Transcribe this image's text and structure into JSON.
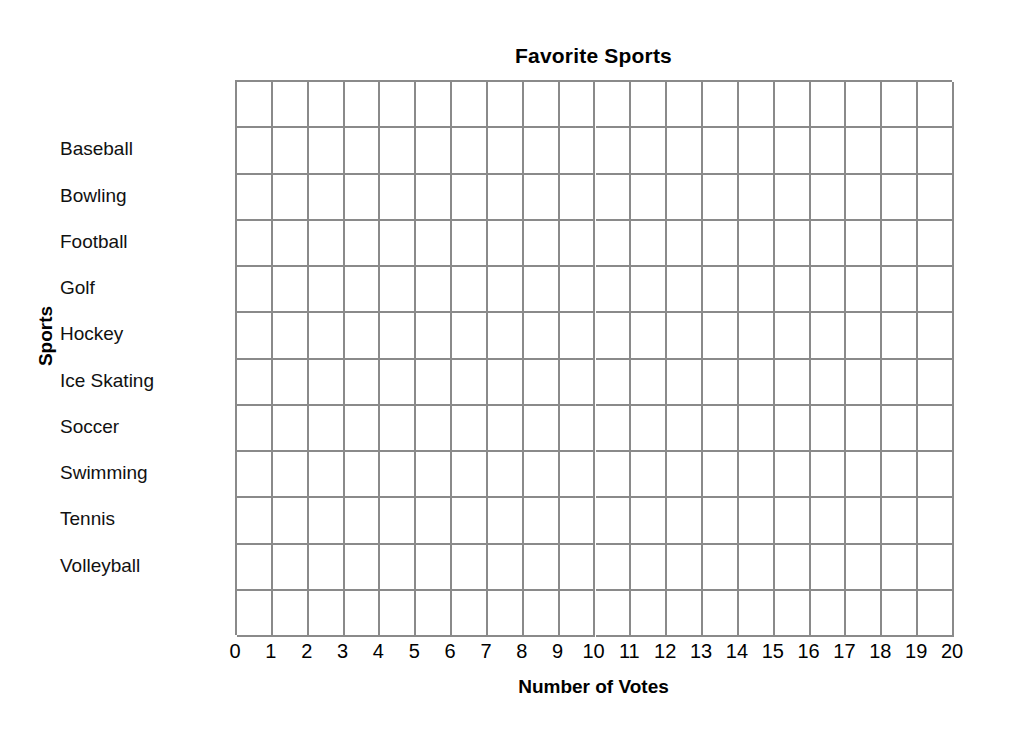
{
  "chart_data": {
    "type": "bar",
    "orientation": "horizontal",
    "title": "Favorite Sports",
    "xlabel": "Number of Votes",
    "ylabel": "Sports",
    "categories": [
      "Baseball",
      "Bowling",
      "Football",
      "Golf",
      "Hockey",
      "Ice Skating",
      "Soccer",
      "Swimming",
      "Tennis",
      "Volleyball"
    ],
    "values": [
      null,
      null,
      null,
      null,
      null,
      null,
      null,
      null,
      null,
      null
    ],
    "xlim": [
      0,
      20
    ],
    "x_ticks": [
      0,
      1,
      2,
      3,
      4,
      5,
      6,
      7,
      8,
      9,
      10,
      11,
      12,
      13,
      14,
      15,
      16,
      17,
      18,
      19,
      20
    ],
    "grid": true,
    "grid_columns": 20,
    "grid_rows": 12,
    "legend": null,
    "note": "blank worksheet grid - no bars drawn"
  },
  "grid_color": "#8a8a8a",
  "text_color": "#000000",
  "background_color": "#ffffff"
}
